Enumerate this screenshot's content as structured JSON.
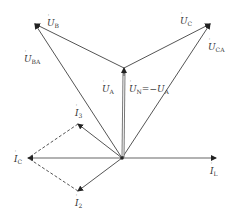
{
  "diagram": {
    "type": "phasor-diagram",
    "origin": [
      122,
      158
    ],
    "vectors": [
      {
        "id": "UB",
        "label": "U",
        "sub": "B",
        "from": [
          124,
          68
        ],
        "to": [
          35,
          24
        ],
        "style": "solid"
      },
      {
        "id": "UC",
        "label": "U",
        "sub": "C",
        "from": [
          124,
          68
        ],
        "to": [
          210,
          24
        ],
        "style": "solid"
      },
      {
        "id": "UBA",
        "label": "U",
        "sub": "BA",
        "from": [
          122,
          158
        ],
        "to": [
          35,
          24
        ],
        "style": "solid"
      },
      {
        "id": "UCA",
        "label": "U",
        "sub": "CA",
        "from": [
          122,
          158
        ],
        "to": [
          210,
          24
        ],
        "style": "solid"
      },
      {
        "id": "UA",
        "label": "U",
        "sub": "A",
        "from": [
          122,
          158
        ],
        "to": [
          124,
          68
        ],
        "style": "thick"
      },
      {
        "id": "IL",
        "label": "I",
        "sub": "L",
        "from": [
          122,
          158
        ],
        "to": [
          216,
          158
        ],
        "style": "solid"
      },
      {
        "id": "IC",
        "label": "I",
        "sub": "C",
        "from": [
          122,
          158
        ],
        "to": [
          28,
          158
        ],
        "style": "solid"
      },
      {
        "id": "I3",
        "label": "I",
        "sub": "3",
        "from": [
          122,
          158
        ],
        "to": [
          78,
          124
        ],
        "style": "solid"
      },
      {
        "id": "I2",
        "label": "I",
        "sub": "2",
        "from": [
          122,
          158
        ],
        "to": [
          78,
          191
        ],
        "style": "solid"
      }
    ],
    "dashed_lines": [
      {
        "from": [
          78,
          124
        ],
        "to": [
          28,
          158
        ]
      },
      {
        "from": [
          78,
          191
        ],
        "to": [
          28,
          158
        ]
      }
    ],
    "labels": {
      "UB": {
        "main": "U",
        "sub": "B",
        "x": 47,
        "y": 26
      },
      "UC": {
        "main": "U",
        "sub": "C",
        "x": 180,
        "y": 24
      },
      "UBA": {
        "main": "U",
        "sub": "BA",
        "x": 24,
        "y": 62
      },
      "UCA": {
        "main": "U",
        "sub": "CA",
        "x": 208,
        "y": 50
      },
      "UA": {
        "main": "U",
        "sub": "A",
        "x": 102,
        "y": 92
      },
      "UN": {
        "main": "U",
        "sub": "N",
        "mid": "=−",
        "main2": "U",
        "sub2": "A",
        "x": 129,
        "y": 92
      },
      "I3": {
        "main": "I",
        "sub": "3",
        "x": 75,
        "y": 116
      },
      "IC": {
        "main": "I",
        "sub": "C",
        "x": 14,
        "y": 162
      },
      "I2": {
        "main": "I",
        "sub": "2",
        "x": 75,
        "y": 206
      },
      "IL": {
        "main": "I",
        "sub": "L",
        "x": 210,
        "y": 174
      }
    }
  }
}
